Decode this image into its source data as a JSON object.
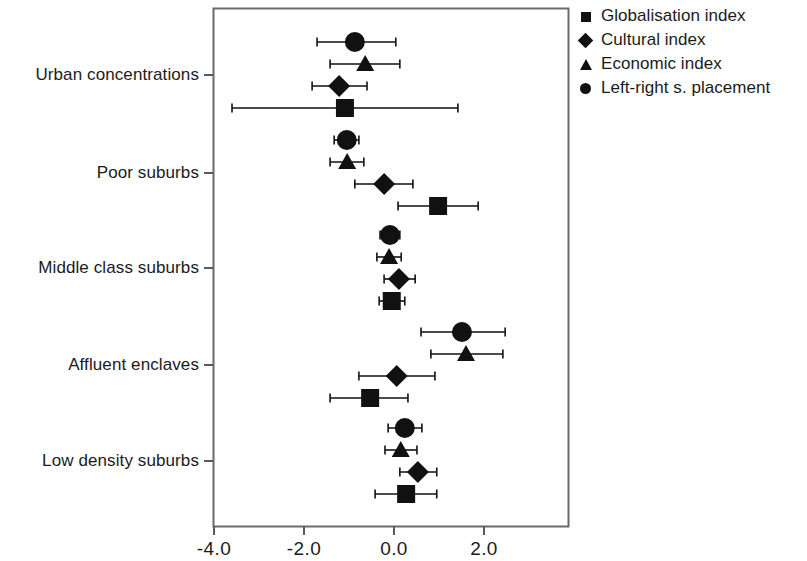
{
  "chart_data": {
    "type": "scatter",
    "title": "",
    "xlabel": "",
    "ylabel": "",
    "xlim": [
      -4.45,
      3.85
    ],
    "ylim": [
      0,
      5
    ],
    "grid": false,
    "orientation": "horizontal",
    "legend_position": "top-right",
    "xticks": [
      -4.0,
      -2.0,
      0.0,
      2.0
    ],
    "xtick_labels": [
      "-4.0",
      "-2.0",
      "0.0",
      "2.0"
    ],
    "categories": [
      "Urban concentrations",
      "Poor suburbs",
      "Middle class suburbs",
      "Affluent enclaves",
      "Low density suburbs"
    ],
    "series": [
      {
        "name": "Globalisation index",
        "marker": "square",
        "values": [
          -1.09,
          0.98,
          -0.05,
          -0.53,
          0.27
        ],
        "ci_low": [
          -3.6,
          0.09,
          -0.33,
          -1.42,
          -0.42
        ],
        "ci_high": [
          1.42,
          1.87,
          0.24,
          0.31,
          0.95
        ]
      },
      {
        "name": "Cultural index",
        "marker": "diamond",
        "values": [
          -1.22,
          -0.22,
          0.11,
          0.06,
          0.53
        ],
        "ci_low": [
          -1.82,
          -0.87,
          -0.22,
          -0.78,
          0.13
        ],
        "ci_high": [
          -0.6,
          0.42,
          0.47,
          0.91,
          0.95
        ]
      },
      {
        "name": "Economic index",
        "marker": "triangle",
        "values": [
          -0.64,
          -1.04,
          -0.11,
          1.6,
          0.15
        ],
        "ci_low": [
          -1.42,
          -1.42,
          -0.38,
          0.82,
          -0.2
        ],
        "ci_high": [
          0.13,
          -0.67,
          0.16,
          2.42,
          0.51
        ]
      },
      {
        "name": "Left-right s. placement",
        "marker": "circle",
        "values": [
          -0.87,
          -1.05,
          -0.09,
          1.51,
          0.24
        ],
        "ci_low": [
          -1.71,
          -1.33,
          -0.31,
          0.6,
          -0.13
        ],
        "ci_high": [
          0.04,
          -0.78,
          0.13,
          2.47,
          0.62
        ]
      }
    ]
  },
  "legend": {
    "items": [
      {
        "label": "Globalisation index",
        "marker": "square-marker-icon"
      },
      {
        "label": "Cultural index",
        "marker": "diamond-marker-icon"
      },
      {
        "label": "Economic index",
        "marker": "triangle-marker-icon"
      },
      {
        "label": "Left-right s. placement",
        "marker": "circle-marker-icon"
      }
    ]
  },
  "axes": {
    "x_tick_labels": [
      "-4.0",
      "-2.0",
      "0.0",
      "2.0"
    ],
    "y_tick_labels": [
      "Urban concentrations",
      "Poor suburbs",
      "Middle class suburbs",
      "Affluent enclaves",
      "Low density suburbs"
    ]
  },
  "colors": {
    "marker": "#111111",
    "axis": "#555555",
    "background": "#ffffff"
  }
}
